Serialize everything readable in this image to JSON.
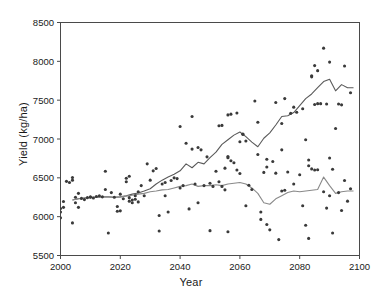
{
  "chart_data": {
    "type": "scatter",
    "title": "",
    "xlabel": "Year",
    "ylabel": "Yield (kg/ha)",
    "xlim": [
      2000,
      2100
    ],
    "ylim": [
      5500,
      8500
    ],
    "xticks": [
      2000,
      2020,
      2040,
      2060,
      2080,
      2100
    ],
    "yticks": [
      5500,
      6000,
      6500,
      7000,
      7500,
      8000,
      8500
    ],
    "xtick_labels": [
      "2000",
      "2020",
      "2040",
      "2060",
      "2080",
      "2100"
    ],
    "ytick_labels": [
      "5500",
      "6000",
      "6500",
      "7000",
      "7500",
      "8000",
      "8500"
    ],
    "grid": false,
    "legend": "none",
    "marker": {
      "shape": "circle",
      "size": 3.1,
      "color": "#3a3a3a"
    },
    "series": [
      {
        "name": "scatter-series-a",
        "type": "scatter",
        "points": [
          [
            2000,
            5985
          ],
          [
            2000,
            6105
          ],
          [
            2000,
            6060
          ],
          [
            2001,
            6195
          ],
          [
            2001,
            6120
          ],
          [
            2002,
            6455
          ],
          [
            2003,
            6440
          ],
          [
            2004,
            6505
          ],
          [
            2004,
            6470
          ],
          [
            2004,
            5920
          ],
          [
            2005,
            6250
          ],
          [
            2005,
            6180
          ],
          [
            2006,
            6120
          ],
          [
            2006,
            6300
          ],
          [
            2007,
            6235
          ],
          [
            2008,
            6220
          ],
          [
            2009,
            6245
          ],
          [
            2010,
            6250
          ],
          [
            2010,
            6255
          ],
          [
            2011,
            6240
          ],
          [
            2012,
            6260
          ],
          [
            2013,
            6270
          ],
          [
            2014,
            6255
          ],
          [
            2015,
            6585
          ],
          [
            2015,
            6350
          ],
          [
            2016,
            5790
          ],
          [
            2017,
            6310
          ],
          [
            2018,
            6250
          ],
          [
            2019,
            6130
          ],
          [
            2019,
            6070
          ],
          [
            2020,
            6075
          ],
          [
            2020,
            6290
          ],
          [
            2021,
            6230
          ],
          [
            2022,
            6495
          ],
          [
            2022,
            6450
          ],
          [
            2023,
            6520
          ],
          [
            2023,
            6245
          ],
          [
            2023,
            6200
          ],
          [
            2024,
            6180
          ],
          [
            2024,
            6215
          ],
          [
            2025,
            6225
          ],
          [
            2025,
            6270
          ],
          [
            2026,
            6190
          ],
          [
            2026,
            6320
          ],
          [
            2027,
            6400
          ],
          [
            2028,
            6270
          ],
          [
            2029,
            6680
          ],
          [
            2030,
            6470
          ],
          [
            2031,
            6590
          ],
          [
            2032,
            6620
          ],
          [
            2033,
            6015
          ],
          [
            2033,
            5815
          ],
          [
            2034,
            6420
          ],
          [
            2035,
            6440
          ],
          [
            2035,
            6270
          ],
          [
            2036,
            6060
          ],
          [
            2037,
            6465
          ],
          [
            2038,
            6500
          ],
          [
            2039,
            6490
          ],
          [
            2040,
            7160
          ],
          [
            2040,
            6370
          ],
          [
            2041,
            6400
          ],
          [
            2042,
            6945
          ],
          [
            2043,
            6100
          ],
          [
            2044,
            7290
          ],
          [
            2044,
            6870
          ],
          [
            2045,
            6420
          ],
          [
            2046,
            6890
          ],
          [
            2046,
            6180
          ],
          [
            2047,
            6860
          ],
          [
            2048,
            6400
          ],
          [
            2049,
            6770
          ],
          [
            2050,
            6430
          ],
          [
            2050,
            5820
          ],
          [
            2051,
            6390
          ],
          [
            2052,
            6585
          ],
          [
            2053,
            7170
          ],
          [
            2053,
            6450
          ],
          [
            2054,
            7175
          ],
          [
            2054,
            6390
          ],
          [
            2055,
            6625
          ],
          [
            2055,
            6345
          ],
          [
            2056,
            7310
          ],
          [
            2056,
            6775
          ],
          [
            2056,
            6760
          ],
          [
            2056,
            5805
          ],
          [
            2057,
            7320
          ],
          [
            2057,
            6720
          ],
          [
            2058,
            6695
          ],
          [
            2059,
            7335
          ],
          [
            2059,
            6600
          ],
          [
            2060,
            6965
          ],
          [
            2060,
            6555
          ],
          [
            2061,
            7060
          ],
          [
            2061,
            7065
          ],
          [
            2062,
            6975
          ],
          [
            2062,
            6140
          ],
          [
            2063,
            6405
          ],
          [
            2064,
            6350
          ],
          [
            2065,
            7490
          ],
          [
            2066,
            7215
          ],
          [
            2066,
            6800
          ],
          [
            2067,
            6060
          ],
          [
            2067,
            5965
          ],
          [
            2068,
            6570
          ],
          [
            2069,
            6740
          ],
          [
            2069,
            6640
          ],
          [
            2069,
            5900
          ],
          [
            2070,
            5830
          ],
          [
            2071,
            6710
          ],
          [
            2072,
            7470
          ],
          [
            2072,
            6560
          ],
          [
            2073,
            5705
          ],
          [
            2074,
            7200
          ],
          [
            2074,
            6860
          ],
          [
            2074,
            6330
          ],
          [
            2075,
            7520
          ],
          [
            2075,
            6340
          ],
          [
            2076,
            6575
          ],
          [
            2077,
            7330
          ],
          [
            2078,
            7410
          ],
          [
            2078,
            6420
          ],
          [
            2079,
            7345
          ],
          [
            2080,
            6540
          ],
          [
            2081,
            7390
          ],
          [
            2081,
            6140
          ],
          [
            2082,
            6990
          ],
          [
            2082,
            5890
          ],
          [
            2083,
            6730
          ],
          [
            2083,
            6655
          ],
          [
            2083,
            5720
          ],
          [
            2084,
            7815
          ],
          [
            2084,
            7800
          ],
          [
            2084,
            6615
          ],
          [
            2085,
            7945
          ],
          [
            2085,
            7445
          ],
          [
            2085,
            6600
          ],
          [
            2086,
            7880
          ],
          [
            2086,
            7455
          ],
          [
            2086,
            6605
          ],
          [
            2087,
            7455
          ],
          [
            2088,
            8170
          ],
          [
            2088,
            6320
          ],
          [
            2089,
            7450
          ],
          [
            2089,
            6110
          ],
          [
            2090,
            7990
          ],
          [
            2090,
            6755
          ],
          [
            2090,
            6270
          ],
          [
            2091,
            6610
          ],
          [
            2091,
            5790
          ],
          [
            2092,
            7135
          ],
          [
            2093,
            7450
          ],
          [
            2093,
            6310
          ],
          [
            2094,
            7440
          ],
          [
            2094,
            6080
          ],
          [
            2095,
            7940
          ],
          [
            2095,
            6465
          ],
          [
            2096,
            6200
          ],
          [
            2097,
            7595
          ],
          [
            2097,
            6360
          ]
        ]
      }
    ],
    "lines": [
      {
        "name": "upper-trend-line",
        "type": "line",
        "color": "#5a5a5a",
        "width": 1.1,
        "x": [
          2004,
          2006,
          2008,
          2010,
          2012,
          2014,
          2016,
          2018,
          2020,
          2022,
          2024,
          2026,
          2028,
          2030,
          2032,
          2034,
          2036,
          2038,
          2040,
          2042,
          2044,
          2046,
          2048,
          2050,
          2052,
          2054,
          2056,
          2058,
          2060,
          2062,
          2064,
          2066,
          2068,
          2070,
          2072,
          2074,
          2076,
          2078,
          2080,
          2082,
          2084,
          2086,
          2088,
          2090,
          2092,
          2094,
          2096,
          2098
        ],
        "y": [
          6215,
          6230,
          6240,
          6250,
          6250,
          6255,
          6255,
          6250,
          6255,
          6270,
          6290,
          6305,
          6330,
          6360,
          6420,
          6470,
          6510,
          6545,
          6590,
          6680,
          6630,
          6700,
          6680,
          6760,
          6830,
          6930,
          6990,
          7050,
          7090,
          7030,
          6960,
          6900,
          7010,
          7080,
          7180,
          7290,
          7300,
          7340,
          7430,
          7520,
          7580,
          7660,
          7740,
          7770,
          7620,
          7700,
          7660,
          7660
        ]
      },
      {
        "name": "lower-trend-line",
        "type": "line",
        "color": "#8a8a8a",
        "width": 1.1,
        "x": [
          2004,
          2006,
          2008,
          2010,
          2012,
          2014,
          2016,
          2018,
          2020,
          2022,
          2024,
          2026,
          2028,
          2030,
          2032,
          2034,
          2036,
          2038,
          2040,
          2042,
          2044,
          2046,
          2048,
          2050,
          2052,
          2054,
          2056,
          2058,
          2060,
          2062,
          2064,
          2066,
          2068,
          2070,
          2072,
          2074,
          2076,
          2078,
          2080,
          2082,
          2084,
          2086,
          2088,
          2090,
          2092,
          2094,
          2096,
          2098
        ],
        "y": [
          6215,
          6230,
          6240,
          6250,
          6250,
          6255,
          6255,
          6250,
          6255,
          6265,
          6275,
          6290,
          6300,
          6320,
          6330,
          6345,
          6350,
          6370,
          6390,
          6400,
          6420,
          6390,
          6400,
          6400,
          6410,
          6400,
          6420,
          6430,
          6440,
          6420,
          6370,
          6300,
          6180,
          6160,
          6230,
          6270,
          6310,
          6330,
          6320,
          6330,
          6340,
          6350,
          6510,
          6400,
          6300,
          6320,
          6330,
          6330
        ]
      }
    ]
  },
  "axes": {
    "x_title": "Year",
    "y_title": "Yield (kg/ha)"
  }
}
